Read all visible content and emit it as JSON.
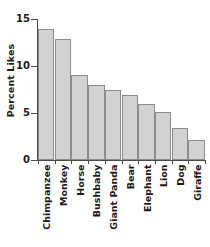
{
  "chart_data": {
    "type": "bar",
    "title": "",
    "xlabel": "",
    "ylabel": "Percent Likes",
    "categories": [
      "Chimpanzee",
      "Monkey",
      "Horse",
      "Bushbaby",
      "Giant Panda",
      "Bear",
      "Elephant",
      "Lion",
      "Dog",
      "Giraffe"
    ],
    "values": [
      13.9,
      12.85,
      9.05,
      8.0,
      7.4,
      6.9,
      6.0,
      5.15,
      3.4,
      2.15
    ],
    "ylim": [
      0,
      15
    ],
    "yticks": [
      0,
      5,
      10,
      15
    ],
    "ytick_labels": [
      "0",
      "5",
      "10",
      "15"
    ],
    "grid": false,
    "legend": "none",
    "bar_fill": "#d2d2d2",
    "bar_edge": "#8c8c8c",
    "axis_color": "#4a4a4a",
    "text_color": "#1a1a1a",
    "background": "#ffffff"
  }
}
